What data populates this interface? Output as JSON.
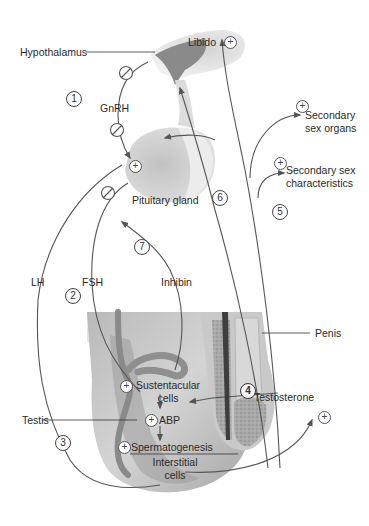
{
  "figure": {
    "labels": {
      "hypothalamus": "Hypothalamus",
      "libido": "Libido",
      "gnrh": "GnRH",
      "secondary_sex_organs_l1": "Secondary",
      "secondary_sex_organs_l2": "sex organs",
      "secondary_sex_char_l1": "Secondary sex",
      "secondary_sex_char_l2": "characteristics",
      "pituitary_gland": "Pituitary gland",
      "lh": "LH",
      "fsh": "FSH",
      "inhibin": "Inhibin",
      "penis": "Penis",
      "sustentacular_l1": "Sustentacular",
      "sustentacular_l2": "cells",
      "testis": "Testis",
      "abp": "ABP",
      "testosterone": "Testosterone",
      "spermatogenesis": "Spermatogenesis",
      "interstitial_l1": "Interstitial",
      "interstitial_l2": "cells"
    },
    "steps": [
      "1",
      "2",
      "3",
      "4",
      "5",
      "6",
      "7"
    ],
    "symbols": {
      "stimulate": "+",
      "inhibit": "⊘"
    },
    "colors": {
      "line": "#555555",
      "tissue_light": "#d9d9d9",
      "tissue_mid": "#b5b5b5",
      "tissue_dark": "#6e6e6e",
      "text": "#2a2a2a"
    }
  }
}
